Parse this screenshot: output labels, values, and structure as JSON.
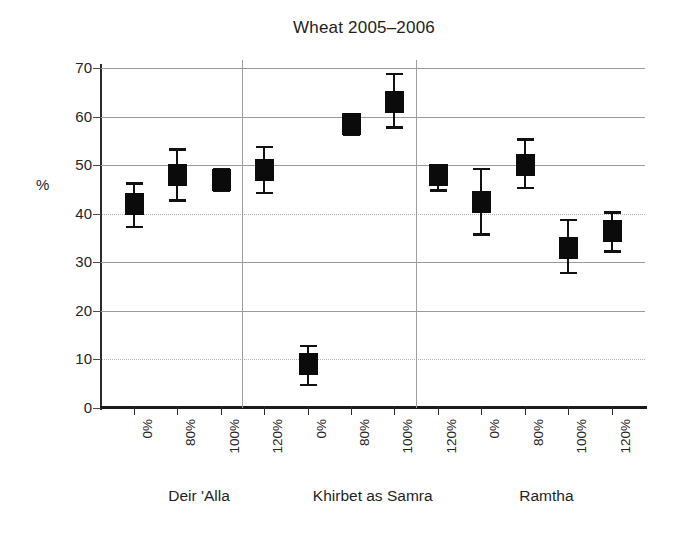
{
  "chart_data": {
    "type": "scatter",
    "title": "Wheat 2005–2006",
    "xlabel": "",
    "ylabel": "%",
    "ylim": [
      0,
      70
    ],
    "yticks": [
      0,
      10,
      20,
      30,
      40,
      50,
      60,
      70
    ],
    "ytick_labels": [
      "0",
      "10",
      "20",
      "30",
      "40",
      "50",
      "60",
      "70"
    ],
    "grid": true,
    "legend": "none",
    "marker_style": "filled-square-with-error-bars",
    "groups": [
      {
        "name": "Deir 'Alla",
        "categories": [
          "0%",
          "80%",
          "100%",
          "120%"
        ],
        "values": [
          42.0,
          48.0,
          47.0,
          49.0
        ],
        "err_low": [
          37.0,
          42.5,
          44.5,
          44.0
        ],
        "err_high": [
          46.5,
          53.5,
          49.5,
          54.0
        ]
      },
      {
        "name": "Khirbet as Samra",
        "categories": [
          "0%",
          "80%",
          "100%",
          "120%"
        ],
        "values": [
          9.0,
          58.5,
          63.0,
          48.0
        ],
        "err_low": [
          4.5,
          56.0,
          57.5,
          44.5
        ],
        "err_high": [
          13.0,
          60.0,
          69.0,
          50.0
        ]
      },
      {
        "name": "Ramtha",
        "categories": [
          "0%",
          "80%",
          "100%",
          "120%"
        ],
        "values": [
          42.5,
          50.0,
          33.0,
          36.5
        ],
        "err_low": [
          35.5,
          45.0,
          27.5,
          32.0
        ],
        "err_high": [
          49.5,
          55.5,
          39.0,
          40.5
        ]
      }
    ]
  }
}
